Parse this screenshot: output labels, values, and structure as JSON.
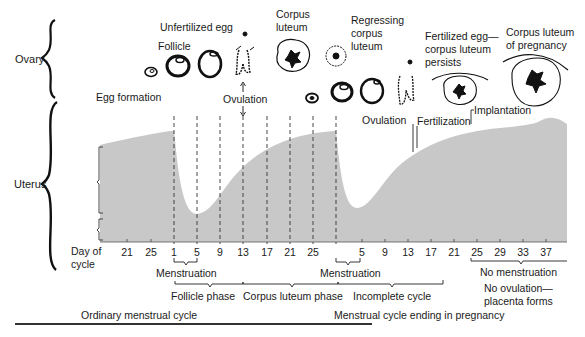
{
  "regions": {
    "ovary": "Ovary",
    "uterus": "Uterus"
  },
  "ovary_labels": {
    "egg_formation": "Egg formation",
    "follicle": "Follicle",
    "unfertilized_egg": "Unfertilized egg",
    "ovulation_1": "Ovulation",
    "corpus_luteum_1": "Corpus",
    "corpus_luteum_2": "luteum",
    "regressing_1": "Regressing",
    "regressing_2": "corpus",
    "regressing_3": "luteum",
    "ovulation_2": "Ovulation",
    "fertilization": "Fertilization",
    "implantation": "Implantation",
    "fertilized_1": "Fertilized egg—",
    "fertilized_2": "corpus luteum",
    "fertilized_3": "persists",
    "cl_pregnancy_1": "Corpus luteum",
    "cl_pregnancy_2": "of pregnancy"
  },
  "axis": {
    "label_1": "Day of",
    "label_2": "cycle",
    "ticks": [
      {
        "label": "21",
        "x": 127
      },
      {
        "label": "25",
        "x": 151
      },
      {
        "label": "1",
        "x": 174
      },
      {
        "label": "5",
        "x": 197
      },
      {
        "label": "9",
        "x": 220
      },
      {
        "label": "13",
        "x": 243
      },
      {
        "label": "17",
        "x": 267
      },
      {
        "label": "21",
        "x": 290
      },
      {
        "label": "25",
        "x": 313
      },
      {
        "label": "5",
        "x": 362
      },
      {
        "label": "9",
        "x": 385
      },
      {
        "label": "13",
        "x": 408
      },
      {
        "label": "17",
        "x": 431
      },
      {
        "label": "21",
        "x": 454
      },
      {
        "label": "25",
        "x": 477
      },
      {
        "label": "29",
        "x": 500
      },
      {
        "label": "33",
        "x": 523
      },
      {
        "label": "37",
        "x": 546
      }
    ]
  },
  "phases": {
    "menstruation_1": "Menstruation",
    "menstruation_2": "Menstruation",
    "follicle_phase": "Follicle phase",
    "corpus_luteum_phase": "Corpus luteum phase",
    "incomplete_cycle": "Incomplete cycle",
    "no_menstruation": "No menstruation",
    "no_ovulation_1": "No ovulation—",
    "no_ovulation_2": "placenta forms",
    "ordinary_cycle": "Ordinary menstrual cycle",
    "pregnancy_cycle": "Menstrual cycle ending in pregnancy"
  },
  "colors": {
    "endometrium_fill": "#c8c8c8",
    "ink": "#1a1a1a"
  }
}
